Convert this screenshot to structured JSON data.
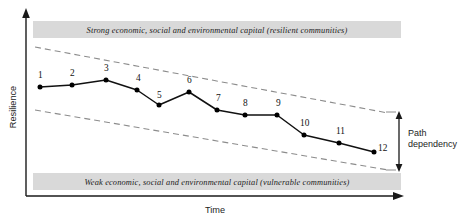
{
  "figure": {
    "title_top_band": "Strong economic, social and environmental capital (resilient communities)",
    "title_bottom_band": "Weak economic, social and environmental capital (vulnerable communities)",
    "y_axis_label": "Resilience",
    "x_axis_label": "Time",
    "annotation_line1": "Path",
    "annotation_line2": "dependency",
    "colors": {
      "band_fill": "#d9d9d9",
      "axis": "#1a1a1a",
      "series_line": "#111111",
      "marker": "#000000",
      "envelope_dash": "#8c8c8c",
      "background": "#ffffff"
    }
  },
  "chart_data": {
    "type": "line",
    "xlabel": "Time",
    "ylabel": "Resilience",
    "grid": false,
    "legend": "none",
    "axis_ranges": {
      "x": [
        0,
        12.6
      ],
      "y": [
        0,
        10
      ]
    },
    "point_labels": [
      "1",
      "2",
      "3",
      "4",
      "5",
      "6",
      "7",
      "8",
      "9",
      "10",
      "11",
      "12"
    ],
    "x": [
      1,
      2,
      3,
      4,
      5,
      6,
      7,
      8,
      9,
      10,
      11,
      12
    ],
    "values": [
      6.9,
      7.1,
      7.6,
      6.9,
      5.8,
      6.8,
      5.5,
      5.2,
      5.2,
      3.9,
      3.3,
      2.6
    ],
    "series": [
      {
        "name": "Community resilience",
        "values": [
          6.9,
          7.1,
          7.6,
          6.9,
          5.8,
          6.8,
          5.5,
          5.2,
          5.2,
          3.9,
          3.3,
          2.6
        ]
      }
    ],
    "envelope": {
      "name": "Path dependency corridor",
      "style": "dashed",
      "upper": {
        "x": [
          0.6,
          12.6
        ],
        "y": [
          9.1,
          5.3
        ]
      },
      "lower": {
        "x": [
          0.6,
          12.6
        ],
        "y": [
          6.3,
          2.1
        ]
      }
    },
    "annotations": [
      {
        "text": "Path dependency",
        "type": "double-arrow",
        "x": 12.8,
        "y_from": 5.3,
        "y_to": 2.1
      }
    ],
    "bands": [
      {
        "position": "top",
        "label": "Strong economic, social and environmental capital (resilient communities)"
      },
      {
        "position": "bottom",
        "label": "Weak economic, social and environmental capital (vulnerable communities)"
      }
    ]
  },
  "points": [
    {
      "label": "1",
      "cx": 40,
      "cy": 87,
      "lx": 38,
      "ly": 78
    },
    {
      "label": "2",
      "cx": 72,
      "cy": 85,
      "lx": 70,
      "ly": 76
    },
    {
      "label": "3",
      "cx": 106,
      "cy": 80,
      "lx": 104,
      "ly": 71
    },
    {
      "label": "4",
      "cx": 137,
      "cy": 90,
      "lx": 136,
      "ly": 81
    },
    {
      "label": "5",
      "cx": 159,
      "cy": 105,
      "lx": 157,
      "ly": 98
    },
    {
      "label": "6",
      "cx": 189,
      "cy": 92,
      "lx": 187,
      "ly": 83
    },
    {
      "label": "7",
      "cx": 217,
      "cy": 110,
      "lx": 216,
      "ly": 101
    },
    {
      "label": "8",
      "cx": 245,
      "cy": 115,
      "lx": 243,
      "ly": 106
    },
    {
      "label": "9",
      "cx": 277,
      "cy": 115,
      "lx": 276,
      "ly": 106
    },
    {
      "label": "10",
      "cx": 304,
      "cy": 135,
      "lx": 300,
      "ly": 126
    },
    {
      "label": "11",
      "cx": 339,
      "cy": 143,
      "lx": 336,
      "ly": 134
    },
    {
      "label": "12",
      "cx": 374,
      "cy": 152,
      "lx": 378,
      "ly": 151
    }
  ]
}
